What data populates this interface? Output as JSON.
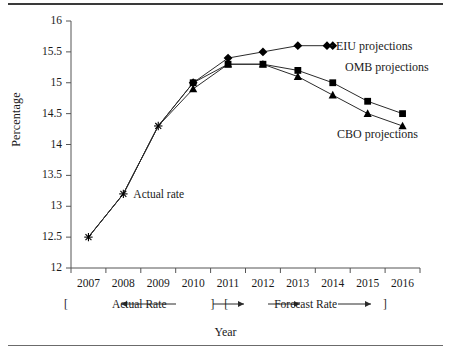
{
  "figure": {
    "y_axis_title": "Percentage",
    "x_axis_title": "Year"
  },
  "annotations": {
    "actual_rate_point": "Actual rate",
    "actual_bracket": "Actual Rate",
    "forecast_bracket": "Forecast Rate",
    "bracket_open": "[",
    "bracket_close": "]"
  },
  "legend": {
    "eiu": "EIU projections",
    "omb": "OMB projections",
    "cbo": "CBO projections"
  },
  "chart_data": {
    "type": "line",
    "title": "",
    "xlabel": "Year",
    "ylabel": "Percentage",
    "xlim": [
      2006.5,
      2016.5
    ],
    "ylim": [
      12,
      16
    ],
    "yticks": [
      12,
      12.5,
      13,
      13.5,
      14,
      14.5,
      15,
      15.5,
      16
    ],
    "ytick_labels": [
      "12",
      "12.5",
      "13",
      "13.5",
      "14",
      "14.5",
      "15",
      "15.5",
      "16"
    ],
    "xticks": [
      2007,
      2008,
      2009,
      2010,
      2011,
      2012,
      2013,
      2014,
      2015,
      2016
    ],
    "xtick_labels": [
      "2007",
      "2008",
      "2009",
      "2010",
      "2011",
      "2012",
      "2013",
      "2014",
      "2015",
      "2016"
    ],
    "grid": false,
    "legend_position": "right-inline",
    "x": [
      2007,
      2008,
      2009,
      2010,
      2011,
      2012,
      2013,
      2014,
      2015,
      2016
    ],
    "series": [
      {
        "name": "EIU projections",
        "marker": "diamond",
        "values": [
          12.5,
          13.2,
          14.3,
          15.0,
          15.4,
          15.5,
          15.6,
          15.6,
          null,
          null
        ]
      },
      {
        "name": "OMB projections",
        "marker": "square",
        "values": [
          12.5,
          13.2,
          14.3,
          15.0,
          15.3,
          15.3,
          15.2,
          15.0,
          14.7,
          14.5
        ]
      },
      {
        "name": "CBO projections",
        "marker": "triangle",
        "values": [
          12.5,
          13.2,
          14.3,
          14.9,
          15.3,
          15.3,
          15.1,
          14.8,
          14.5,
          14.3
        ]
      }
    ],
    "phases": [
      {
        "label": "Actual Rate",
        "from": 2007,
        "to": 2010
      },
      {
        "label": "Forecast Rate",
        "from": 2011,
        "to": 2016
      }
    ]
  }
}
